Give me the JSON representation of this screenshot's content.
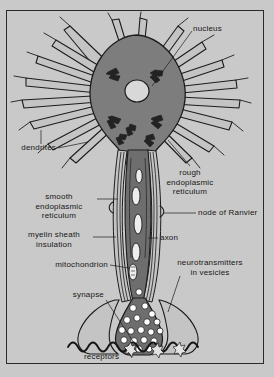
{
  "figure": {
    "background_color": "#c9c9c9",
    "frame_color": "#2a2a2a",
    "ink_color": "#171717",
    "soma_fill": "#7d7d7d",
    "axon_fill": "#6e6e6e",
    "membrane_fill": "#c4c4c4",
    "vesicle_fill": "#ffffff"
  },
  "labels": {
    "nucleus": "nucleus",
    "dendrites": "dendrites",
    "rough_er": "rough\nendoplasmic\nreticulum",
    "smooth_er": "smooth\nendoplasmic\nreticulum",
    "node_of_ranvier": "node of Ranvier",
    "myelin_sheath": "myelin sheath\ninsulation",
    "axon": "axon",
    "mitochondrion": "mitochondrion",
    "neurotransmitters": "neurotransmitters\nin vesicles",
    "synapse": "synapse",
    "receptors": "receptors"
  }
}
